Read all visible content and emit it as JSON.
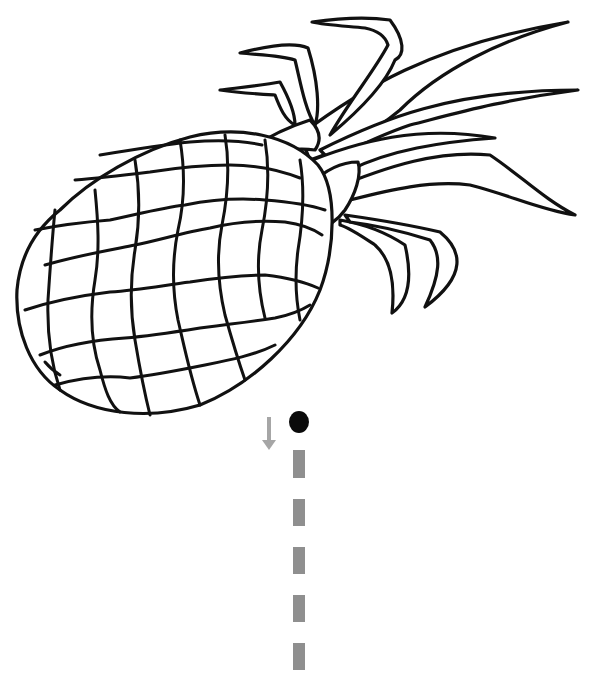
{
  "worksheet": {
    "subject": "pineapple",
    "activity": "trace-line",
    "colors": {
      "background": "#ffffff",
      "outline": "#111111",
      "trace_line": "#8f8f8f",
      "direction_arrow": "#a6a6a6",
      "start_dot": "#0a0a0a"
    },
    "start_dot": {
      "cx": 299,
      "cy": 422,
      "r": 10
    },
    "direction_arrow": {
      "x": 269,
      "y_top": 417,
      "y_bottom": 450,
      "direction": "down"
    },
    "trace_line": {
      "x": 293,
      "width": 12,
      "dashes": [
        {
          "y": 450,
          "h": 28
        },
        {
          "y": 499,
          "h": 27
        },
        {
          "y": 547,
          "h": 27
        },
        {
          "y": 595,
          "h": 27
        },
        {
          "y": 643,
          "h": 27
        },
        {
          "y": 692,
          "h": 14
        }
      ]
    }
  }
}
